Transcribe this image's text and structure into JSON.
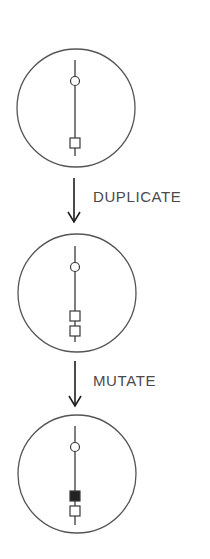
{
  "diagram": {
    "title": "",
    "colors": {
      "stroke": "#3a3a3a",
      "cell_outline": "#555555",
      "label_text": "#4a4a4a",
      "mutated_gene_fill": "#222222",
      "background": "#ffffff"
    },
    "stages": [
      {
        "id": "original",
        "cell": {
          "cx": 76,
          "cy": 108,
          "r": 59
        },
        "chromosome": {
          "x": 75,
          "y1": 60,
          "y2": 156
        },
        "centromere": {
          "cy": 81,
          "r": 4.5
        },
        "genes": [
          {
            "y": 138,
            "filled": false
          }
        ]
      },
      {
        "id": "duplicated",
        "cell": {
          "cx": 77,
          "cy": 293,
          "r": 59
        },
        "chromosome": {
          "x": 75,
          "y1": 246,
          "y2": 342
        },
        "centromere": {
          "cy": 267,
          "r": 4.5
        },
        "genes": [
          {
            "y": 311,
            "filled": false
          },
          {
            "y": 326,
            "filled": false
          }
        ]
      },
      {
        "id": "mutated",
        "cell": {
          "cx": 77,
          "cy": 474,
          "r": 59
        },
        "chromosome": {
          "x": 75,
          "y1": 426,
          "y2": 525
        },
        "centromere": {
          "cy": 447,
          "r": 4.5
        },
        "genes": [
          {
            "y": 491,
            "filled": true
          },
          {
            "y": 506,
            "filled": false
          }
        ]
      }
    ],
    "transitions": [
      {
        "label": "DUPLICATE",
        "arrow": {
          "x": 74,
          "y1": 178,
          "y2": 222
        },
        "label_pos": {
          "x": 93,
          "y": 189
        }
      },
      {
        "label": "MUTATE",
        "arrow": {
          "x": 75,
          "y1": 361,
          "y2": 406
        },
        "label_pos": {
          "x": 93,
          "y": 373
        }
      }
    ]
  }
}
